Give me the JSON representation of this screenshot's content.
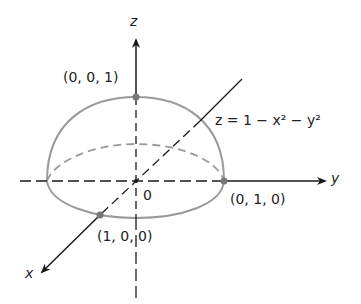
{
  "diagram": {
    "axes": {
      "x": "x",
      "y": "y",
      "z": "z"
    },
    "origin_label": "0",
    "equation": "z = 1 − x² − y²",
    "points": [
      {
        "label": "(0, 0, 1)",
        "role": "apex"
      },
      {
        "label": "(0, 1, 0)",
        "role": "y-intercept"
      },
      {
        "label": "(1, 0, 0)",
        "role": "x-intercept"
      }
    ],
    "colors": {
      "axis": "#1a1a1a",
      "surface": "#9a9a9a",
      "point": "#777777"
    }
  }
}
